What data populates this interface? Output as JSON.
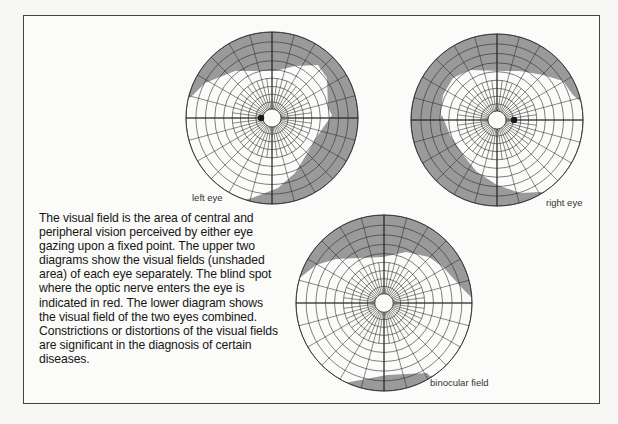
{
  "figure": {
    "caption": "The visual field is the area of central and peripheral vision perceived by either eye gazing upon a fixed point. The upper two diagrams show the visual fields (unshaded area) of each eye separately. The blind spot where the optic nerve enters the eye is indicated in red. The lower diagram shows the visual field of the two eyes combined. Constrictions or distortions of the visual fields are significant in the diagnosis of certain diseases.",
    "diagrams": [
      {
        "id": "left",
        "label": "left eye",
        "cx": 272,
        "cy": 118,
        "r": 86,
        "blind_spot": {
          "x": 261,
          "y": 118
        }
      },
      {
        "id": "right",
        "label": "right eye",
        "cx": 497,
        "cy": 120,
        "r": 86,
        "blind_spot": {
          "x": 514,
          "y": 120
        }
      },
      {
        "id": "binocular",
        "label": "binocular field",
        "cx": 384,
        "cy": 303,
        "r": 88,
        "blind_spot": null
      }
    ],
    "colors": {
      "shaded": "#9a9a9a",
      "grid": "#2a2a2a",
      "paper": "#fbfbf9",
      "blind_spot": "#1a1a1a"
    }
  }
}
